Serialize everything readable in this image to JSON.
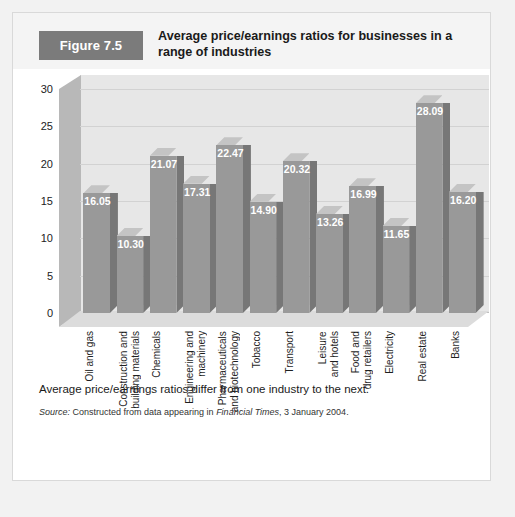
{
  "header": {
    "badge": "Figure 7.5",
    "title": "Average price/earnings ratios for businesses in a range of industries"
  },
  "colors": {
    "badge_bg": "#7b7b7b",
    "header_bg": "#f4f4f4",
    "card_bg": "#ffffff",
    "page_bg": "#f2f2f2",
    "bar_front": "#999999",
    "bar_side": "#777777",
    "bar_top": "#c4c4c4",
    "backwall": "#e7e7e7",
    "leftwall": "#b8b8b8",
    "floor": "#dcdcdc",
    "gridline": "#d2d2d2",
    "value_label": "#ffffff"
  },
  "footer": {
    "caption": "Average price/earnings ratios differ from one industry to the next.",
    "source_lead": "Source:",
    "source_text_1": " Constructed from data appearing in ",
    "source_publication": "Financial Times",
    "source_text_2": ", 3 January 2004."
  },
  "chart_data": {
    "type": "bar",
    "title": "Average price/earnings ratios for businesses in a range of industries",
    "xlabel": "",
    "ylabel": "",
    "ylim": [
      0,
      30
    ],
    "yticks": [
      0,
      5,
      10,
      15,
      20,
      25,
      30
    ],
    "ytick_labels": [
      "0",
      "5",
      "10",
      "15",
      "20",
      "25",
      "30"
    ],
    "grid": true,
    "legend": "none",
    "three_d": true,
    "categories": [
      "Oil and gas",
      "Construction and\nbuilding materials",
      "Chemicals",
      "Engineering and\nmachinery",
      "Pharmaceuticals\nand biotechnology",
      "Tobacco",
      "Transport",
      "Leisure\nand hotels",
      "Food and\ndrug retailers",
      "Electricity",
      "Real estate",
      "Banks"
    ],
    "values": [
      16.05,
      10.3,
      21.07,
      17.31,
      22.47,
      14.9,
      20.32,
      13.26,
      16.99,
      11.65,
      28.09,
      16.2
    ],
    "value_labels": [
      "16.05",
      "10.30",
      "21.07",
      "17.31",
      "22.47",
      "14.90",
      "20.32",
      "13.26",
      "16.99",
      "11.65",
      "28.09",
      "16.20"
    ]
  }
}
